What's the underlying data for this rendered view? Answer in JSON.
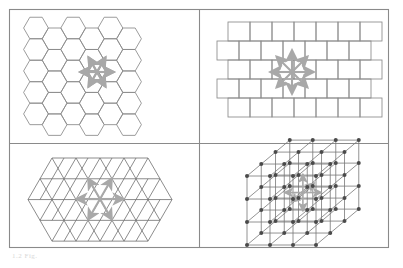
{
  "figure": {
    "caption": "1.2  Fig.",
    "panel_count": 4,
    "frame_color": "#888888",
    "background_color": "#ffffff",
    "tile_stroke_color": "#8a8a8a",
    "arrow_color": "#a8a8a8",
    "node_color": "#4a4a4a",
    "lattice_edge_color": "#777777"
  },
  "panels": [
    {
      "id": "panel-hexagonal",
      "name": "hexagonal-tiling-panel",
      "label": "Hexagonal tiling",
      "position": "top-left",
      "tiling_type": "hexagonal",
      "neighbour_count": 6,
      "arrow_count": 6,
      "arrow_angles_deg": [
        0,
        60,
        120,
        180,
        240,
        300
      ],
      "rows": 5,
      "columns": 5
    },
    {
      "id": "panel-brick",
      "name": "brick-tiling-panel",
      "label": "Brick (running bond) tiling",
      "position": "top-right",
      "tiling_type": "brick",
      "neighbour_count": 8,
      "arrow_count": 8,
      "arrow_angles_deg": [
        0,
        45,
        90,
        135,
        180,
        225,
        270,
        315
      ],
      "rows": 5,
      "columns": 6
    },
    {
      "id": "panel-triangular",
      "name": "triangular-tiling-panel",
      "label": "Triangular tiling",
      "position": "bottom-left",
      "tiling_type": "triangular",
      "neighbour_count": 6,
      "arrow_count": 6,
      "arrow_angles_deg": [
        0,
        60,
        120,
        180,
        240,
        300
      ],
      "rows": 4,
      "columns": 6
    },
    {
      "id": "panel-cubic",
      "name": "cubic-lattice-panel",
      "label": "Cubic 3D lattice",
      "position": "bottom-right",
      "tiling_type": "cubic-3d",
      "neighbour_count": 6,
      "arrow_count": 6,
      "grid_size": 3,
      "node_count": 64
    }
  ],
  "chart_data": {
    "type": "diagram",
    "items": [
      {
        "name": "Hexagonal tiling",
        "neighbours": 6,
        "dimension": 2
      },
      {
        "name": "Brick tiling",
        "neighbours": 8,
        "dimension": 2
      },
      {
        "name": "Triangular tiling",
        "neighbours": 6,
        "dimension": 2
      },
      {
        "name": "Cubic lattice",
        "neighbours": 6,
        "dimension": 3
      }
    ]
  }
}
